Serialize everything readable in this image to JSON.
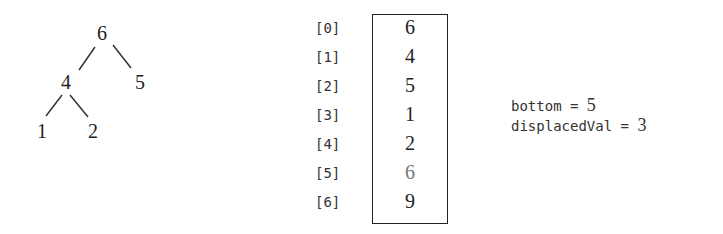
{
  "tree": {
    "nodes": [
      {
        "id": "root",
        "value": "6"
      },
      {
        "id": "left",
        "value": "4"
      },
      {
        "id": "right",
        "value": "5"
      },
      {
        "id": "left-left",
        "value": "1"
      },
      {
        "id": "left-right",
        "value": "2"
      }
    ]
  },
  "array": {
    "indices": [
      "[0]",
      "[1]",
      "[2]",
      "[3]",
      "[4]",
      "[5]",
      "[6]"
    ],
    "values": [
      "6",
      "4",
      "5",
      "1",
      "2",
      "6",
      "9"
    ],
    "dimmed_index": 5,
    "dimmed_color": "#777777"
  },
  "variables": {
    "bottom_label": "bottom = ",
    "bottom_value": "5",
    "displaced_label": "displacedVal = ",
    "displaced_value": "3"
  }
}
